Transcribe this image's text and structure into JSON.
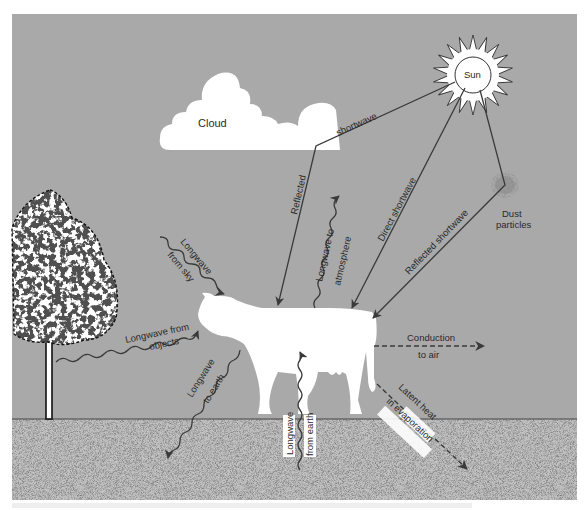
{
  "diagram": {
    "colors": {
      "sky": "#a9a9a9",
      "ground": "#b8b8b8",
      "ground_line": "#444444",
      "objects": "#ffffff",
      "arrow": "#3a3a3a",
      "page": "#ffffff"
    },
    "elements": {
      "sun": "Sun",
      "cloud": "Cloud",
      "dust": "Dust",
      "dust_line2": "particles"
    },
    "labels": {
      "shortwave": "shortwave",
      "reflected": "Reflected",
      "direct_shortwave": "Direct shortwave",
      "reflected_shortwave": "Reflected shortwave",
      "longwave_to_atmosphere_1": "Longwave to",
      "longwave_to_atmosphere_2": "atmosphere",
      "longwave_from_sky_1": "Longwave",
      "longwave_from_sky_2": "from sky",
      "longwave_from_objects_1": "Longwave from",
      "longwave_from_objects_2": "objects",
      "longwave_to_earth_1": "Longwave",
      "longwave_to_earth_2": "to earth",
      "longwave_from_earth_1": "Longwave",
      "longwave_from_earth_2": "from earth",
      "conduction_1": "Conduction",
      "conduction_2": "to air",
      "latent_heat_1": "Latent heat",
      "latent_heat_2": "in evaporation"
    },
    "flows": [
      {
        "from": "Sun",
        "to": "Cloud",
        "type": "shortwave",
        "style": "solid"
      },
      {
        "from": "Cloud",
        "to": "Cow",
        "type": "Reflected",
        "style": "solid"
      },
      {
        "from": "Sun",
        "to": "Cow",
        "type": "Direct shortwave",
        "style": "solid"
      },
      {
        "from": "Sun",
        "to": "Dust particles",
        "type": "shortwave",
        "style": "solid"
      },
      {
        "from": "Dust particles",
        "to": "Cow",
        "type": "Reflected shortwave",
        "style": "solid"
      },
      {
        "from": "Cow",
        "to": "Atmosphere",
        "type": "Longwave to atmosphere",
        "style": "wavy"
      },
      {
        "from": "Sky",
        "to": "Cow",
        "type": "Longwave from sky",
        "style": "wavy"
      },
      {
        "from": "Tree",
        "to": "Cow",
        "type": "Longwave from objects",
        "style": "wavy"
      },
      {
        "from": "Cow",
        "to": "Earth",
        "type": "Longwave to earth",
        "style": "wavy"
      },
      {
        "from": "Earth",
        "to": "Cow",
        "type": "Longwave from earth",
        "style": "wavy"
      },
      {
        "from": "Cow",
        "to": "Air",
        "type": "Conduction to air",
        "style": "dashed"
      },
      {
        "from": "Cow",
        "to": "Ground",
        "type": "Latent heat in evaporation",
        "style": "dashed"
      }
    ]
  }
}
